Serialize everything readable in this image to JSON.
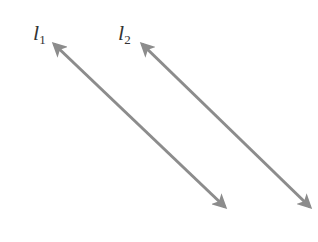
{
  "diagram": {
    "line_color": "#8c8c8c",
    "lines": [
      {
        "name": "l",
        "subscript": "1",
        "x1": 54,
        "y1": 44,
        "x2": 225,
        "y2": 207,
        "label_x": 33,
        "label_y": 22
      },
      {
        "name": "l",
        "subscript": "2",
        "x1": 142,
        "y1": 44,
        "x2": 310,
        "y2": 207,
        "label_x": 118,
        "label_y": 22
      }
    ]
  }
}
